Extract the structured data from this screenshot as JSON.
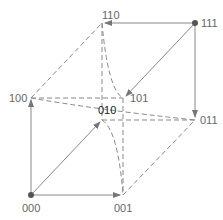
{
  "diagram": {
    "type": "hypercube-3d",
    "colors": {
      "edge": "#888888",
      "node": "#555555",
      "label": "#666666"
    },
    "nodes": [
      {
        "id": "000",
        "label": "000",
        "x": 31,
        "y": 195
      },
      {
        "id": "001",
        "label": "001",
        "x": 123,
        "y": 195
      },
      {
        "id": "100",
        "label": "100",
        "x": 31,
        "y": 98
      },
      {
        "id": "101",
        "label": "101",
        "x": 123,
        "y": 98
      },
      {
        "id": "010",
        "label": "010",
        "x": 102,
        "y": 120
      },
      {
        "id": "011",
        "label": "011",
        "x": 195,
        "y": 120
      },
      {
        "id": "110",
        "label": "110",
        "x": 102,
        "y": 23
      },
      {
        "id": "111",
        "label": "111",
        "x": 195,
        "y": 23
      }
    ],
    "labels": {
      "n000": "000",
      "n001": "001",
      "n100": "100",
      "n101": "101",
      "n010": "010",
      "n011": "011",
      "n110": "110",
      "n111": "111"
    }
  }
}
